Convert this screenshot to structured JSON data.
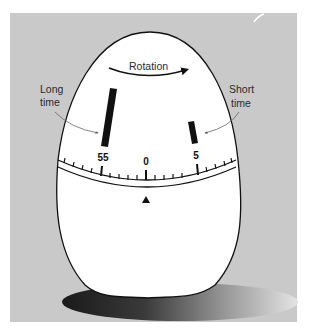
{
  "figure": {
    "background_color": "#c9c9c9",
    "egg_color": "#ffffff",
    "outline_color": "#111111",
    "annotations": {
      "rotation": "Rotation",
      "long_time_line1": "Long",
      "long_time_line2": "time",
      "short_time_line1": "Short",
      "short_time_line2": "time"
    },
    "dial": {
      "labels": {
        "left": "55",
        "center": "0",
        "right": "5"
      },
      "pointer": "triangle-pointer"
    },
    "bars": {
      "long": "long-time-bar",
      "short": "short-time-bar"
    }
  }
}
